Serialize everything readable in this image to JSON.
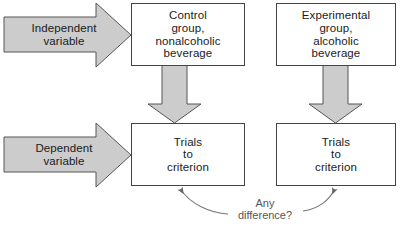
{
  "diagram": {
    "colors": {
      "arrow_fill": "#cccccc",
      "arrow_stroke": "#555555",
      "box_fill": "#ffffff",
      "box_stroke": "#444444",
      "text": "#1a1a1a",
      "annotation_text": "#555555",
      "curve_stroke": "#777777",
      "background": "#ffffff"
    },
    "row_labels": [
      {
        "id": "independent-variable",
        "text": "Independent\nvariable",
        "shape": "block-arrow-right"
      },
      {
        "id": "dependent-variable",
        "text": "Dependent\nvariable",
        "shape": "block-arrow-right"
      }
    ],
    "boxes": [
      {
        "id": "control-group",
        "text": "Control\ngroup,\nnonalcoholic\nbeverage",
        "column": "left",
        "row": "top"
      },
      {
        "id": "experimental-group",
        "text": "Experimental\ngroup,\nalcoholic\nbeverage",
        "column": "right",
        "row": "top"
      },
      {
        "id": "trials-to-criterion-left",
        "text": "Trials\nto\ncriterion",
        "column": "left",
        "row": "bottom"
      },
      {
        "id": "trials-to-criterion-right",
        "text": "Trials\nto\ncriterion",
        "column": "right",
        "row": "bottom"
      }
    ],
    "connectors": [
      {
        "id": "down-arrow-left",
        "shape": "block-arrow-down",
        "from": "control-group",
        "to": "trials-to-criterion-left"
      },
      {
        "id": "down-arrow-right",
        "shape": "block-arrow-down",
        "from": "experimental-group",
        "to": "trials-to-criterion-right"
      },
      {
        "id": "comparison-curve",
        "shape": "double-headed-curve",
        "from": "trials-to-criterion-left",
        "to": "trials-to-criterion-right"
      }
    ],
    "annotation": {
      "id": "any-difference",
      "line1": "Any",
      "line2": "difference?"
    }
  }
}
